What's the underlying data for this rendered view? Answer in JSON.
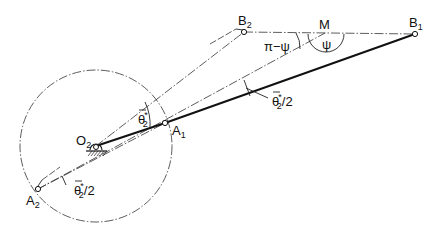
{
  "figure": {
    "type": "four-bar linkage geometry diagram",
    "points": {
      "O2": {
        "label": "O",
        "sub": "2",
        "x": 96,
        "y": 146
      },
      "A1": {
        "label": "A",
        "sub": "1",
        "x": 165,
        "y": 123
      },
      "A2": {
        "label": "A",
        "sub": "2",
        "x": 38,
        "y": 189
      },
      "B1": {
        "label": "B",
        "sub": "1",
        "x": 415,
        "y": 34
      },
      "B2": {
        "label": "B",
        "sub": "2",
        "x": 244,
        "y": 32
      },
      "M": {
        "label": "M",
        "x": 325,
        "y": 33
      }
    },
    "crank_circle": {
      "cx": 96,
      "cy": 146,
      "r": 76
    },
    "angle_labels": {
      "pi_minus_psi": "π−ψ",
      "psi": "ψ",
      "theta_star_main": "θ",
      "theta_star_sup": "*",
      "theta_star_sub": "2",
      "half_suffix": "/2"
    },
    "colors": {
      "line": "#111111",
      "background": "#ffffff"
    }
  }
}
